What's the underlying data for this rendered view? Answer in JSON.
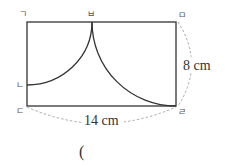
{
  "diagram": {
    "type": "geometry-figure",
    "shape": "rectangle with two quarter-circle arcs",
    "vertices": {
      "top_left": "ㄱ",
      "top_mid": "ㅂ",
      "top_right": "ㅁ",
      "left_mid": "ㄴ",
      "bottom_left": "ㄷ",
      "bottom_right": "ㄹ"
    },
    "dimensions": {
      "height_label": "8 cm",
      "width_label": "14 cm"
    },
    "answer_paren": "(",
    "colors": {
      "line": "#333333",
      "dashed": "#aaaaaa",
      "background": "#ffffff"
    }
  }
}
